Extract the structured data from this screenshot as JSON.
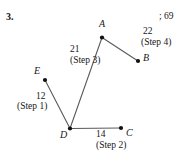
{
  "problem": {
    "number": "3.",
    "answer_note": "; 69"
  },
  "diagram": {
    "type": "graph-tree",
    "vertices": [
      {
        "id": "A",
        "label": "A",
        "x": 102,
        "y": 37.5,
        "label_x": 99,
        "label_y": 19
      },
      {
        "id": "B",
        "label": "B",
        "x": 138,
        "y": 61,
        "label_x": 143,
        "label_y": 53
      },
      {
        "id": "C",
        "label": "C",
        "x": 121,
        "y": 128,
        "label_x": 126,
        "label_y": 128
      },
      {
        "id": "D",
        "label": "D",
        "x": 70,
        "y": 128.5,
        "label_x": 60,
        "label_y": 130
      },
      {
        "id": "E",
        "label": "E",
        "x": 45,
        "y": 80,
        "label_x": 34,
        "label_y": 66
      }
    ],
    "edges": [
      {
        "from": "E",
        "to": "D",
        "weight": "12",
        "step": "(Step 1)",
        "weight_x": 36,
        "weight_y": 92,
        "step_x": 17,
        "step_y": 102
      },
      {
        "from": "D",
        "to": "C",
        "weight": "14",
        "step": "(Step 2)",
        "weight_x": 96,
        "weight_y": 130,
        "step_x": 96,
        "step_y": 141
      },
      {
        "from": "D",
        "to": "A",
        "weight": "21",
        "step": "(Step 3)",
        "weight_x": 70,
        "weight_y": 45,
        "step_x": 70,
        "step_y": 56
      },
      {
        "from": "A",
        "to": "B",
        "weight": "22",
        "step": "(Step 4)",
        "weight_x": 143,
        "weight_y": 27,
        "step_x": 141,
        "step_y": 38
      }
    ],
    "colors": {
      "edge": "#5a5a5a",
      "vertex": "#101010",
      "text": "#161616",
      "background": "#ffffff"
    }
  }
}
